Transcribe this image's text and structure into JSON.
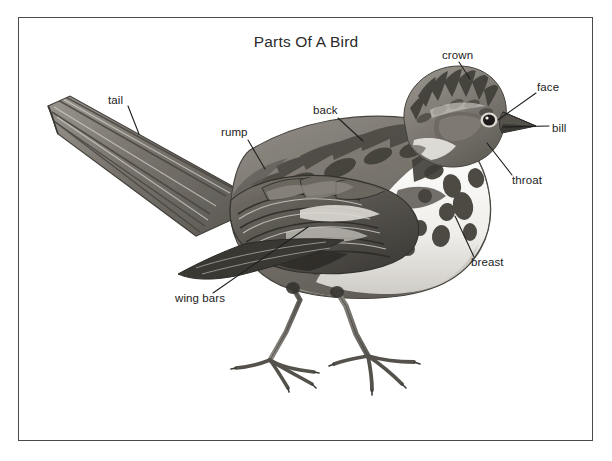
{
  "figure": {
    "title": "Parts Of A Bird",
    "frame_color": "#4a4a4a",
    "background_color": "#ffffff",
    "ink_color": "#222222"
  },
  "labels": [
    {
      "key": "tail",
      "text": "tail",
      "x": 110,
      "y": 100,
      "anchor": "start",
      "line": [
        128,
        106,
        139,
        134
      ]
    },
    {
      "key": "rump",
      "text": "rump",
      "x": 222,
      "y": 133,
      "anchor": "start",
      "line": [
        248,
        140,
        265,
        169
      ]
    },
    {
      "key": "back",
      "text": "back",
      "x": 314,
      "y": 111,
      "anchor": "start",
      "line": [
        338,
        118,
        363,
        141
      ]
    },
    {
      "key": "crown",
      "text": "crown",
      "x": 443,
      "y": 56,
      "anchor": "start",
      "line": [
        459,
        62,
        470,
        79
      ]
    },
    {
      "key": "face",
      "text": "face",
      "x": 538,
      "y": 88,
      "anchor": "start",
      "line": [
        536,
        93,
        498,
        120
      ]
    },
    {
      "key": "bill",
      "text": "bill",
      "x": 553,
      "y": 129,
      "anchor": "start",
      "line": [
        549,
        126,
        503,
        127
      ]
    },
    {
      "key": "throat",
      "text": "throat",
      "x": 513,
      "y": 181,
      "anchor": "start",
      "line": [
        512,
        175,
        487,
        143
      ]
    },
    {
      "key": "breast",
      "text": "breast",
      "x": 472,
      "y": 263,
      "anchor": "start",
      "line": [
        474,
        257,
        455,
        216
      ]
    },
    {
      "key": "wing-bars",
      "text": "wing bars",
      "x": 176,
      "y": 299,
      "anchor": "start",
      "line": [
        213,
        293,
        308,
        227
      ]
    }
  ]
}
